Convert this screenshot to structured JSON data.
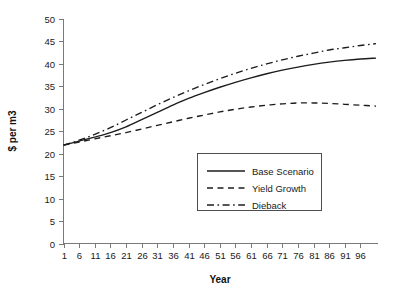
{
  "chart_data": {
    "type": "line",
    "title": "",
    "xlabel": "Year",
    "ylabel": "$ per m3",
    "xlim": [
      1,
      101
    ],
    "ylim": [
      0,
      50
    ],
    "grid": false,
    "legend_position": "center-right",
    "x_ticks": [
      1,
      6,
      11,
      16,
      21,
      26,
      31,
      36,
      41,
      46,
      51,
      56,
      61,
      66,
      71,
      76,
      81,
      86,
      91,
      96
    ],
    "y_ticks": [
      0,
      5,
      10,
      15,
      20,
      25,
      30,
      35,
      40,
      45,
      50
    ],
    "x": [
      1,
      6,
      11,
      16,
      21,
      26,
      31,
      36,
      41,
      46,
      51,
      56,
      61,
      66,
      71,
      76,
      81,
      86,
      91,
      96,
      101
    ],
    "series": [
      {
        "name": "Base Scenario",
        "style": "solid",
        "values": [
          21.9,
          22.8,
          23.7,
          24.7,
          26.0,
          27.6,
          29.2,
          30.8,
          32.3,
          33.6,
          34.8,
          35.9,
          36.9,
          37.8,
          38.6,
          39.3,
          39.9,
          40.4,
          40.8,
          41.1,
          41.3
        ]
      },
      {
        "name": "Yield Growth",
        "style": "dashed",
        "values": [
          21.9,
          22.6,
          23.3,
          24.0,
          24.7,
          25.5,
          26.3,
          27.1,
          27.9,
          28.6,
          29.3,
          29.9,
          30.4,
          30.8,
          31.1,
          31.3,
          31.3,
          31.2,
          31.0,
          30.8,
          30.6
        ]
      },
      {
        "name": "Dieback",
        "style": "dashdot",
        "values": [
          21.9,
          23.0,
          24.3,
          25.8,
          27.5,
          29.2,
          30.9,
          32.5,
          34.0,
          35.4,
          36.7,
          37.9,
          39.0,
          40.0,
          40.9,
          41.7,
          42.4,
          43.1,
          43.6,
          44.1,
          44.5
        ]
      }
    ]
  },
  "legend": {
    "items": [
      {
        "label": "Base Scenario"
      },
      {
        "label": "Yield Growth"
      },
      {
        "label": "Dieback"
      }
    ]
  },
  "colors": {
    "line": "#1c1c1c",
    "axis": "#7a7a7a",
    "text": "#1a1a1a",
    "background": "#ffffff"
  }
}
